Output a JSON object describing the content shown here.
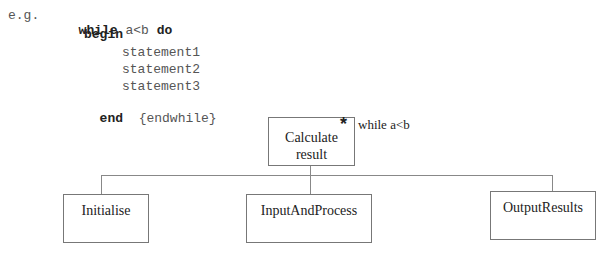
{
  "code": {
    "prefix": "e.g.",
    "line1_kw1": "while",
    "line1_cond": "a<b",
    "line1_kw2": "do",
    "begin": "begin",
    "statements": [
      "statement1",
      "statement2",
      "statement3"
    ],
    "end": "end",
    "end_comment": "{endwhile}"
  },
  "diagram": {
    "root": {
      "label_line1": "Calculate",
      "label_line2": "result",
      "iteration_marker": "*",
      "condition": "while a<b"
    },
    "children": [
      {
        "label": "Initialise"
      },
      {
        "label": "InputAndProcess"
      },
      {
        "label": "OutputResults"
      }
    ]
  }
}
